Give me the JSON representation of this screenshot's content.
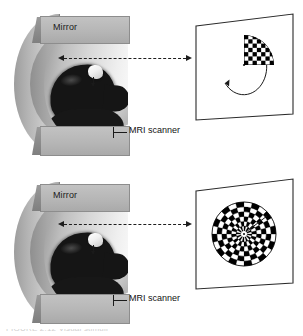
{
  "figure": {
    "caption": "FIGURE 2.12 Visual stimuli"
  },
  "panels": [
    {
      "id": "top",
      "scanner": {
        "mirror_label": "Mirror",
        "scanner_label": "MRI scanner",
        "mirror_icon": "mirror-block-icon",
        "head_icon": "head-silhouette-icon"
      },
      "lightpath": {
        "icon": "dashed-double-arrow-icon",
        "style": "dashed",
        "arrowheads": "both"
      },
      "stimulus": {
        "name": "rotating-checkerboard-wedge",
        "type": "wedge",
        "checker_rows": 7,
        "checker_cols": 7,
        "wedge_start_deg": -90,
        "wedge_end_deg": 0,
        "rotation_arrow": "counterclockwise-arc-arrow-icon",
        "fixation_point": true,
        "colors": {
          "on": "#000000",
          "off": "#ffffff"
        }
      }
    },
    {
      "id": "bottom",
      "scanner": {
        "mirror_label": "Mirror",
        "scanner_label": "MRI scanner",
        "mirror_icon": "mirror-block-icon",
        "head_icon": "head-silhouette-icon"
      },
      "lightpath": {
        "icon": "dashed-double-arrow-icon",
        "style": "dashed",
        "arrowheads": "both"
      },
      "stimulus": {
        "name": "expanding-checkerboard-rings",
        "type": "concentric-rings",
        "ring_count": 6,
        "sectors_per_ring": 24,
        "radial_marker": true,
        "fixation_point": true,
        "colors": {
          "on": "#000000",
          "off": "#ffffff"
        }
      }
    }
  ],
  "colors": {
    "scanner_body": "#b4b4b4",
    "scanner_slab": "#bbbbbb",
    "head": "#151515",
    "ink": "#1a1a1a",
    "screen_fill": "#ffffff",
    "background": "#ffffff"
  }
}
